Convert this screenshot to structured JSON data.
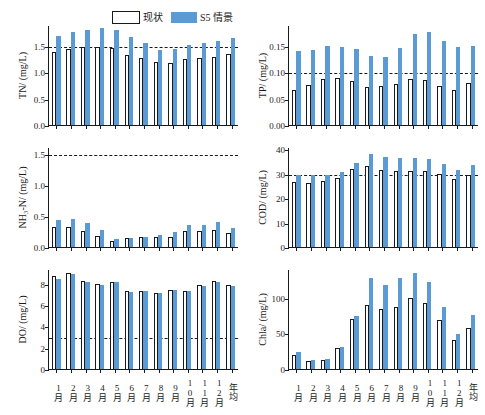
{
  "legend": {
    "items": [
      {
        "label": "现状",
        "style": "outline",
        "color": "#ffffff"
      },
      {
        "label": "S5 情景",
        "style": "filled",
        "color": "#5b9bd5"
      }
    ]
  },
  "categories": [
    "1月",
    "2月",
    "3月",
    "4月",
    "5月",
    "6月",
    "7月",
    "8月",
    "9月",
    "10月",
    "11月",
    "12月",
    "年均"
  ],
  "chart_data": [
    {
      "type": "bar",
      "id": "tn",
      "title": "",
      "ylabel": "TN/ (mg/L)",
      "xlabel": "",
      "ylim": [
        0.0,
        1.9
      ],
      "yticks": [
        0.0,
        0.5,
        1.0,
        1.5
      ],
      "ytick_labels": [
        "0.0",
        "0.5",
        "1.0",
        "1.5"
      ],
      "reference_line": 1.5,
      "grid": false,
      "legend_position": "top-center",
      "categories": [
        "1月",
        "2月",
        "3月",
        "4月",
        "5月",
        "6月",
        "7月",
        "8月",
        "9月",
        "10月",
        "11月",
        "12月",
        "年均"
      ],
      "series": [
        {
          "name": "现状",
          "values": [
            1.38,
            1.45,
            1.49,
            1.49,
            1.47,
            1.33,
            1.28,
            1.2,
            1.17,
            1.26,
            1.27,
            1.3,
            1.35
          ]
        },
        {
          "name": "S5 情景",
          "values": [
            1.69,
            1.76,
            1.81,
            1.85,
            1.81,
            1.67,
            1.55,
            1.42,
            1.44,
            1.52,
            1.55,
            1.6,
            1.65
          ]
        }
      ]
    },
    {
      "type": "bar",
      "id": "tp",
      "title": "",
      "ylabel": "TP/ (mg/L)",
      "xlabel": "",
      "ylim": [
        0.0,
        0.19
      ],
      "yticks": [
        0.0,
        0.05,
        0.1,
        0.15
      ],
      "ytick_labels": [
        "0.00",
        "0.05",
        "0.10",
        "0.15"
      ],
      "reference_line": 0.1,
      "grid": false,
      "categories": [
        "1月",
        "2月",
        "3月",
        "4月",
        "5月",
        "6月",
        "7月",
        "8月",
        "9月",
        "10月",
        "11月",
        "12月",
        "年均"
      ],
      "series": [
        {
          "name": "现状",
          "values": [
            0.066,
            0.076,
            0.088,
            0.089,
            0.083,
            0.072,
            0.074,
            0.077,
            0.087,
            0.085,
            0.075,
            0.067,
            0.079
          ]
        },
        {
          "name": "S5 情景",
          "values": [
            0.14,
            0.142,
            0.15,
            0.149,
            0.145,
            0.131,
            0.13,
            0.147,
            0.172,
            0.177,
            0.16,
            0.148,
            0.15
          ]
        }
      ]
    },
    {
      "type": "bar",
      "id": "nh3n",
      "title": "",
      "ylabel": "NH₃-N/ (mg/L)",
      "xlabel": "",
      "ylim": [
        0.0,
        1.62
      ],
      "yticks": [
        0.0,
        0.5,
        1.0,
        1.5
      ],
      "ytick_labels": [
        "0.0",
        "0.5",
        "1.0",
        "1.5"
      ],
      "reference_line": 1.5,
      "grid": false,
      "categories": [
        "1月",
        "2月",
        "3月",
        "4月",
        "5月",
        "6月",
        "7月",
        "8月",
        "9月",
        "10月",
        "11月",
        "12月",
        "年均"
      ],
      "series": [
        {
          "name": "现状",
          "values": [
            0.32,
            0.32,
            0.26,
            0.18,
            0.1,
            0.14,
            0.16,
            0.16,
            0.17,
            0.26,
            0.26,
            0.28,
            0.22
          ]
        },
        {
          "name": "S5 情景",
          "values": [
            0.44,
            0.46,
            0.39,
            0.27,
            0.13,
            0.15,
            0.17,
            0.19,
            0.25,
            0.35,
            0.35,
            0.4,
            0.3
          ]
        }
      ]
    },
    {
      "type": "bar",
      "id": "cod",
      "title": "",
      "ylabel": "COD/ (mg/L)",
      "xlabel": "",
      "ylim": [
        0,
        41
      ],
      "yticks": [
        0,
        10,
        20,
        30,
        40
      ],
      "ytick_labels": [
        "0",
        "10",
        "20",
        "30",
        "40"
      ],
      "reference_line": 30,
      "grid": false,
      "categories": [
        "1月",
        "2月",
        "3月",
        "4月",
        "5月",
        "6月",
        "7月",
        "8月",
        "9月",
        "10月",
        "11月",
        "12月",
        "年均"
      ],
      "series": [
        {
          "name": "现状",
          "values": [
            26.5,
            26.3,
            27.0,
            28.3,
            32.0,
            33.2,
            31.6,
            31.0,
            31.3,
            31.3,
            30.0,
            28.0,
            29.7
          ]
        },
        {
          "name": "S5 情景",
          "values": [
            29.5,
            29.5,
            29.5,
            30.8,
            34.5,
            38.2,
            37.0,
            36.6,
            36.6,
            36.0,
            34.2,
            31.4,
            33.8
          ]
        }
      ]
    },
    {
      "type": "bar",
      "id": "do",
      "title": "",
      "ylabel": "DO/ (mg/L)",
      "xlabel": "",
      "ylim": [
        0,
        9.4
      ],
      "yticks": [
        0,
        2,
        4,
        6,
        8
      ],
      "ytick_labels": [
        "0",
        "2",
        "4",
        "6",
        "8"
      ],
      "reference_line": 3,
      "grid": false,
      "categories": [
        "1月",
        "2月",
        "3月",
        "4月",
        "5月",
        "6月",
        "7月",
        "8月",
        "9月",
        "10月",
        "11月",
        "12月",
        "年均"
      ],
      "series": [
        {
          "name": "现状",
          "values": [
            8.7,
            9.0,
            8.3,
            8.0,
            8.2,
            7.3,
            7.3,
            7.1,
            7.4,
            7.3,
            7.9,
            8.3,
            7.9
          ]
        },
        {
          "name": "S5 情景",
          "values": [
            8.5,
            8.9,
            8.2,
            7.9,
            8.2,
            7.2,
            7.3,
            7.1,
            7.4,
            7.3,
            7.8,
            8.2,
            7.8
          ]
        }
      ]
    },
    {
      "type": "bar",
      "id": "chla",
      "title": "",
      "ylabel": "Chla/ (mg/L)",
      "xlabel": "",
      "ylim": [
        0,
        140
      ],
      "yticks": [
        0,
        50,
        100
      ],
      "ytick_labels": [
        "0",
        "50",
        "100"
      ],
      "reference_line": null,
      "grid": false,
      "categories": [
        "1月",
        "2月",
        "3月",
        "4月",
        "5月",
        "6月",
        "7月",
        "8月",
        "9月",
        "10月",
        "11月",
        "12月",
        "年均"
      ],
      "series": [
        {
          "name": "现状",
          "values": [
            20,
            11,
            13,
            29,
            70,
            90,
            84,
            87,
            99,
            93,
            68,
            40,
            58
          ]
        },
        {
          "name": "S5 情景",
          "values": [
            24,
            12,
            14,
            31,
            74,
            127,
            118,
            127,
            134,
            122,
            87,
            49,
            76
          ]
        }
      ]
    }
  ]
}
